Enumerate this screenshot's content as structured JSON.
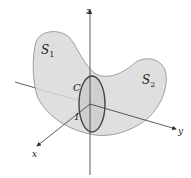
{
  "figure": {
    "surfaces": [
      {
        "label": "S",
        "subscript": "1"
      },
      {
        "label": "S",
        "subscript": "2"
      }
    ],
    "curve": {
      "label": "C"
    },
    "tick": {
      "label": "1"
    },
    "axes": {
      "x": "x",
      "y": "y",
      "z": "z"
    },
    "colors": {
      "surface_fill": "#d9d9d9",
      "surface_stroke": "#8a8a8a",
      "axis": "#333333",
      "curve": "#444444"
    }
  }
}
